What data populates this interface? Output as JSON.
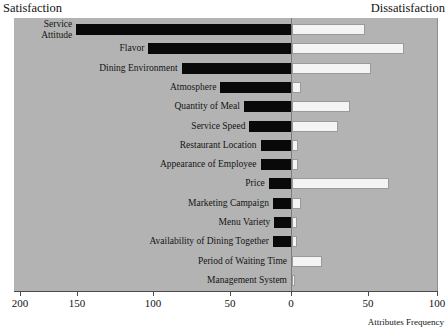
{
  "header": {
    "left_label": "Satisfaction",
    "right_label": "Dissatisfaction"
  },
  "axis": {
    "title": "Attributes Frequency",
    "tick_labels": [
      "200",
      "150",
      "100",
      "50",
      "0",
      "50",
      "100"
    ]
  },
  "colors": {
    "plot_background": "#b3b3b3",
    "satisfaction_bar": "#090909",
    "dissatisfaction_bar": "#f4f4f4",
    "bar_border": "#9a9a9a",
    "axis": "#4a4a4a",
    "text": "#141414"
  },
  "chart_data": {
    "type": "bar",
    "title": "",
    "subtitle": "",
    "orientation": "horizontal",
    "layout": "diverging-tornado",
    "xlabel": "Attributes Frequency",
    "ylabel": "",
    "xlim": [
      -200,
      100
    ],
    "xticks": [
      -200,
      -150,
      -100,
      -50,
      0,
      50,
      100
    ],
    "xticklabels": [
      "200",
      "150",
      "100",
      "50",
      "0",
      "50",
      "100"
    ],
    "grid": false,
    "legend": "none",
    "left_axis_title": "Satisfaction",
    "right_axis_title": "Dissatisfaction",
    "categories": [
      "Service Attitude",
      "Flavor",
      "Dining Environment",
      "Atmosphere",
      "Quantity of Meal",
      "Service Speed",
      "Restaurant Location",
      "Appearance of Employee",
      "Price",
      "Marketing Campaign",
      "Menu Variety",
      "Availability of Dining Together",
      "Period of Waiting Time",
      "Management System"
    ],
    "series": [
      {
        "name": "Satisfaction",
        "direction": "left",
        "values": [
          155,
          103,
          79,
          51,
          34,
          30,
          22,
          22,
          16,
          13,
          12,
          13,
          0,
          0
        ]
      },
      {
        "name": "Dissatisfaction",
        "direction": "right",
        "values": [
          48,
          74,
          52,
          6,
          38,
          30,
          4,
          4,
          64,
          6,
          3,
          3,
          20,
          2
        ]
      }
    ]
  },
  "rows": [
    {
      "label": "Service\nAttitude",
      "label_lines": [
        "Service",
        "Attitude"
      ],
      "satisfaction": 155,
      "dissatisfaction": 48
    },
    {
      "label": "Flavor",
      "satisfaction": 103,
      "dissatisfaction": 74
    },
    {
      "label": "Dining Environment",
      "satisfaction": 79,
      "dissatisfaction": 52
    },
    {
      "label": "Atmosphere",
      "satisfaction": 51,
      "dissatisfaction": 6
    },
    {
      "label": "Quantity of Meal",
      "satisfaction": 34,
      "dissatisfaction": 38
    },
    {
      "label": "Service Speed",
      "satisfaction": 30,
      "dissatisfaction": 30
    },
    {
      "label": "Restaurant Location",
      "satisfaction": 22,
      "dissatisfaction": 4
    },
    {
      "label": "Appearance of Employee",
      "satisfaction": 22,
      "dissatisfaction": 4
    },
    {
      "label": "Price",
      "satisfaction": 16,
      "dissatisfaction": 64
    },
    {
      "label": "Marketing Campaign",
      "satisfaction": 13,
      "dissatisfaction": 6
    },
    {
      "label": "Menu Variety",
      "satisfaction": 12,
      "dissatisfaction": 3
    },
    {
      "label": "Availability of Dining Together",
      "satisfaction": 13,
      "dissatisfaction": 3
    },
    {
      "label": "Period of Waiting Time",
      "satisfaction": 0,
      "dissatisfaction": 20
    },
    {
      "label": "Management System",
      "satisfaction": 0,
      "dissatisfaction": 2
    }
  ]
}
